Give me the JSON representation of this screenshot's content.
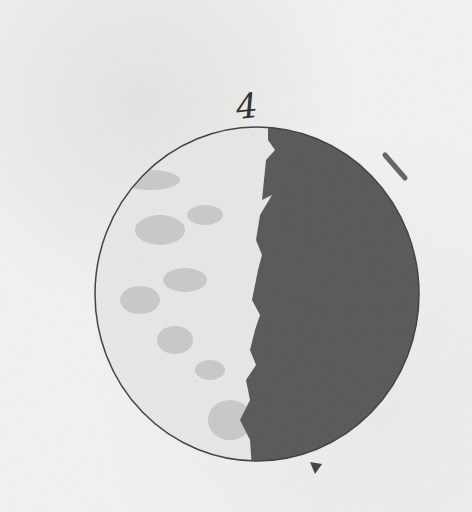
{
  "image": {
    "subject": "Hand-drawn sketch of the Moon phase",
    "label": "4",
    "colors": {
      "paper": "#f3f3f2",
      "dark_side": "#555555",
      "lit_side": "#e6e6e4",
      "outline": "#444444"
    }
  }
}
